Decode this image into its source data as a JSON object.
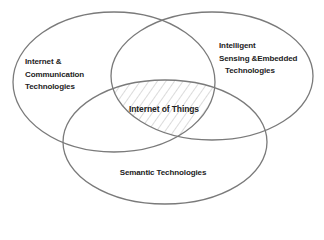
{
  "diagram": {
    "type": "venn",
    "sets": [
      {
        "id": "internet-communication",
        "lines": [
          "Internet &",
          "Communication",
          "Technologies"
        ]
      },
      {
        "id": "intelligent-sensing",
        "lines": [
          "Intelligent",
          "Sensing &Embedded",
          "Technologies"
        ]
      },
      {
        "id": "semantic",
        "lines": [
          "Semantic Technologies"
        ]
      }
    ],
    "intersection": {
      "label": "Internet of Things",
      "fill": "hatched"
    },
    "colors": {
      "stroke": "#7a7a7a",
      "hatch": "#b8b8b8",
      "text": "#222222",
      "background": "#ffffff"
    }
  }
}
